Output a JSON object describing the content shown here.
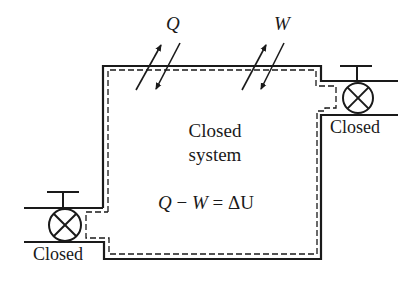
{
  "diagram": {
    "title_lines": [
      "Closed",
      "system"
    ],
    "equation": {
      "q": "Q",
      "minus": "−",
      "w": "W",
      "equals": "=",
      "delta_u": "ΔU"
    },
    "heat_label": "Q",
    "work_label": "W",
    "left_valve_label": "Closed",
    "right_valve_label": "Closed",
    "colors": {
      "line": "#1a1a1a",
      "background": "#ffffff"
    }
  }
}
